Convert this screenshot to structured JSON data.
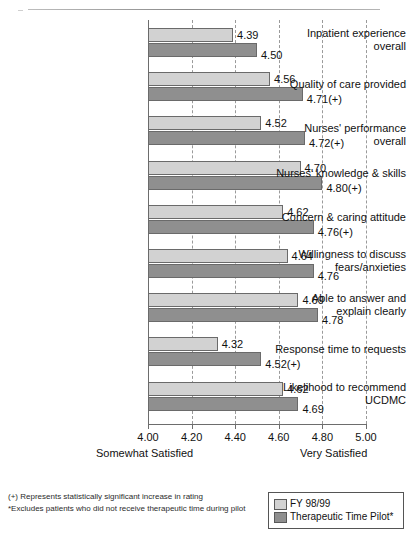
{
  "chart_data": {
    "type": "bar",
    "orientation": "horizontal",
    "title": "",
    "xlabel": "",
    "ylabel": "",
    "xlim": [
      4.0,
      5.0
    ],
    "xticks": [
      "4.00",
      "4.20",
      "4.40",
      "4.60",
      "4.80",
      "5.00"
    ],
    "xtick_values": [
      4.0,
      4.2,
      4.4,
      4.6,
      4.8,
      5.0
    ],
    "grid": true,
    "grid_style": "dashed-vertical",
    "legend_position": "bottom-right",
    "axis_anchor_low": "Somewhat Satisfied",
    "axis_anchor_high": "Very Satisfied",
    "categories": [
      "Inpatient experience overall",
      "Quality of care provided",
      "Nurses' performance overall",
      "Nurses' knowledge & skills",
      "Concern & caring attitude",
      "Willingness to discuss fears/anxieties",
      "Able to answer and explain clearly",
      "Response time to requests",
      "Likelihood to recommend UCDMC"
    ],
    "category_lines": [
      [
        "Inpatient experience",
        "overall"
      ],
      [
        "Quality of care provided"
      ],
      [
        "Nurses' performance overall"
      ],
      [
        "Nurses' knowledge & skills"
      ],
      [
        "Concern & caring attitude"
      ],
      [
        "Willingness to discuss",
        "fears/anxieties"
      ],
      [
        "Able to answer and",
        "explain clearly"
      ],
      [
        "Response time to requests"
      ],
      [
        "Likelihood to recommend",
        "UCDMC"
      ]
    ],
    "series": [
      {
        "name": "FY 98/99",
        "color": "#d2d2d2",
        "values": [
          4.39,
          4.56,
          4.52,
          4.7,
          4.62,
          4.64,
          4.69,
          4.32,
          4.62
        ],
        "labels": [
          "4.39",
          "4.56",
          "4.52",
          "4.70",
          "4.62",
          "4.64",
          "4.69",
          "4.32",
          "4.62"
        ]
      },
      {
        "name": "Therapeutic Time Pilot*",
        "color": "#8f8f8f",
        "values": [
          4.5,
          4.71,
          4.72,
          4.8,
          4.76,
          4.76,
          4.78,
          4.52,
          4.69
        ],
        "labels": [
          "4.50",
          "4.71(+)",
          "4.72(+)",
          "4.80(+)",
          "4.76(+)",
          "4.76",
          "4.78",
          "4.52(+)",
          "4.69"
        ]
      }
    ]
  },
  "legend": {
    "items": [
      {
        "label": "FY 98/99",
        "swatch": "s0"
      },
      {
        "label": "Therapeutic Time Pilot*",
        "swatch": "s1"
      }
    ]
  },
  "footnotes": [
    "(+) Represents statistically significant increase in rating",
    "*Excludes patients who did not receive therapeutic time during pilot"
  ]
}
